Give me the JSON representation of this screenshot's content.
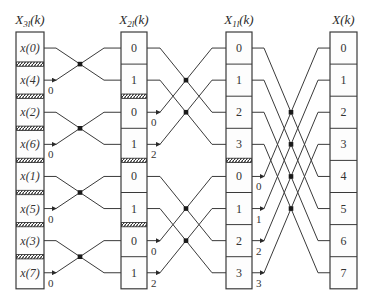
{
  "diagram": {
    "type": "fft-butterfly-decimation-in-time",
    "columns": [
      {
        "id": "stage0",
        "title_main": "X",
        "title_sub": "3,l",
        "title_arg": "(k)",
        "cells": [
          "x(0)",
          "x(4)",
          "x(2)",
          "x(6)",
          "x(1)",
          "x(5)",
          "x(3)",
          "x(7)"
        ],
        "hatch_after_rows": [
          0,
          1,
          2,
          3,
          4,
          5,
          6
        ]
      },
      {
        "id": "stage1",
        "title_main": "X",
        "title_sub": "2,l",
        "title_arg": "(k)",
        "cells": [
          "0",
          "1",
          "0",
          "1",
          "0",
          "1",
          "0",
          "1"
        ],
        "hatch_after_rows": [
          1,
          3,
          5
        ]
      },
      {
        "id": "stage2",
        "title_main": "X",
        "title_sub": "1,l",
        "title_arg": "(k)",
        "cells": [
          "0",
          "1",
          "2",
          "3",
          "0",
          "1",
          "2",
          "3"
        ],
        "hatch_after_rows": [
          3
        ]
      },
      {
        "id": "stage3",
        "title_main": "X",
        "title_sub": "",
        "title_arg": "(k)",
        "cells": [
          "0",
          "1",
          "2",
          "3",
          "4",
          "5",
          "6",
          "7"
        ],
        "hatch_after_rows": []
      }
    ],
    "stages": [
      {
        "span": 1,
        "twiddles": [
          {
            "row": 1,
            "label": "0"
          },
          {
            "row": 3,
            "label": "0"
          },
          {
            "row": 5,
            "label": "0"
          },
          {
            "row": 7,
            "label": "0"
          }
        ]
      },
      {
        "span": 2,
        "twiddles": [
          {
            "row": 2,
            "label": "0"
          },
          {
            "row": 3,
            "label": "2"
          },
          {
            "row": 6,
            "label": "0"
          },
          {
            "row": 7,
            "label": "2"
          }
        ]
      },
      {
        "span": 4,
        "twiddles": [
          {
            "row": 4,
            "label": "0"
          },
          {
            "row": 5,
            "label": "1"
          },
          {
            "row": 6,
            "label": "2"
          },
          {
            "row": 7,
            "label": "3"
          }
        ]
      }
    ],
    "colors": {
      "line": "#3a3a3a",
      "dot": "#1a1a1a",
      "background": "#ffffff",
      "text": "#2a2a2a"
    }
  }
}
